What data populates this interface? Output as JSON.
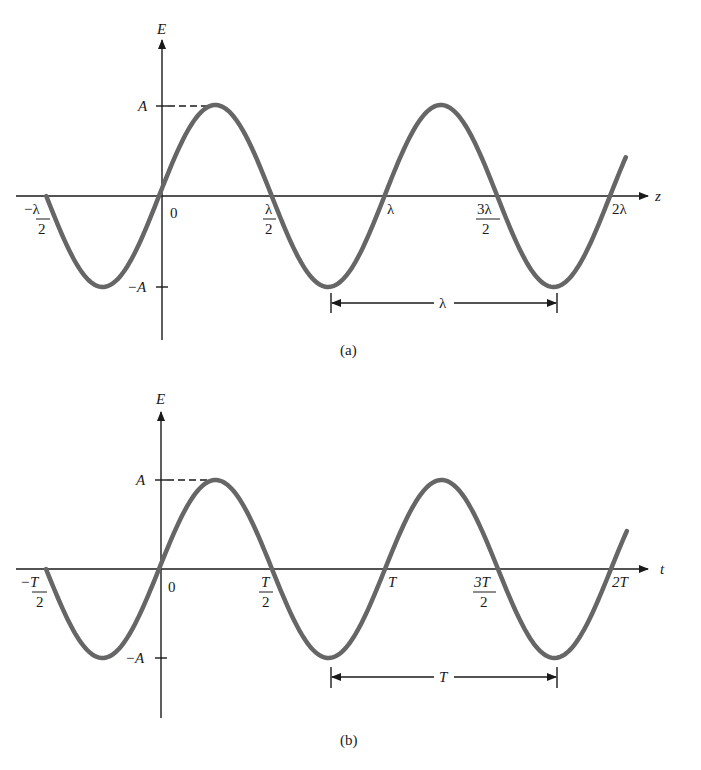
{
  "panels": [
    {
      "id": "a",
      "caption": "(a)",
      "y_axis_label": "E",
      "x_axis_label": "z",
      "amplitude_labels": {
        "positive": "A",
        "negative": "−A"
      },
      "tick_labels": [
        {
          "num": "−λ",
          "den": "2"
        },
        {
          "text": "0"
        },
        {
          "num": "λ",
          "den": "2"
        },
        {
          "text": "λ"
        },
        {
          "num": "3λ",
          "den": "2"
        },
        {
          "text": "2λ"
        }
      ],
      "span_label": "λ",
      "italic": false
    },
    {
      "id": "b",
      "caption": "(b)",
      "y_axis_label": "E",
      "x_axis_label": "t",
      "amplitude_labels": {
        "positive": "A",
        "negative": "−A"
      },
      "tick_labels": [
        {
          "num": "−T",
          "den": "2"
        },
        {
          "text": "0"
        },
        {
          "num": "T",
          "den": "2"
        },
        {
          "text": "T"
        },
        {
          "num": "3T",
          "den": "2"
        },
        {
          "text": "2T"
        }
      ],
      "span_label": "T",
      "italic": true
    }
  ],
  "colors": {
    "curve": "#666666",
    "axis": "#1a1a1a",
    "background": "#ffffff"
  },
  "chart_data": [
    {
      "type": "line",
      "title": "(a)",
      "xlabel": "z",
      "ylabel": "E",
      "function": "E = A sin(2π z / λ)",
      "x": [
        -0.5,
        -0.25,
        0,
        0.25,
        0.5,
        0.75,
        1.0,
        1.25,
        1.5,
        1.75,
        2.0
      ],
      "x_units": "λ",
      "values": [
        0,
        -1,
        0,
        1,
        0,
        -1,
        0,
        1,
        0,
        -1,
        0
      ],
      "y_units": "A",
      "xticks": [
        "−λ/2",
        "0",
        "λ/2",
        "λ",
        "3λ/2",
        "2λ"
      ],
      "yticks": [
        "A",
        "−A"
      ],
      "annotations": [
        "dashed line from A tick to first peak",
        "double arrow spanning one wavelength λ between troughs"
      ],
      "xlim": [
        -0.5,
        2.05
      ],
      "ylim": [
        -1.6,
        1.6
      ],
      "grid": false
    },
    {
      "type": "line",
      "title": "(b)",
      "xlabel": "t",
      "ylabel": "E",
      "function": "E = A sin(2π t / T)",
      "x": [
        -0.5,
        -0.25,
        0,
        0.25,
        0.5,
        0.75,
        1.0,
        1.25,
        1.5,
        1.75,
        2.0
      ],
      "x_units": "T",
      "values": [
        0,
        -1,
        0,
        1,
        0,
        -1,
        0,
        1,
        0,
        -1,
        0
      ],
      "y_units": "A",
      "xticks": [
        "−T/2",
        "0",
        "T/2",
        "T",
        "3T/2",
        "2T"
      ],
      "yticks": [
        "A",
        "−A"
      ],
      "annotations": [
        "dashed line from A tick to first peak",
        "double arrow spanning one period T between troughs"
      ],
      "xlim": [
        -0.5,
        2.05
      ],
      "ylim": [
        -1.6,
        1.6
      ],
      "grid": false
    }
  ]
}
